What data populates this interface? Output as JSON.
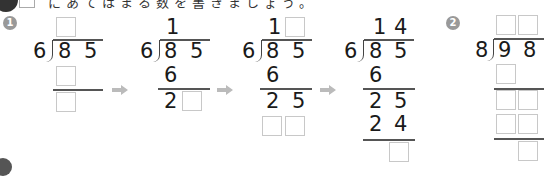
{
  "header": {
    "instruction": "にあてはまる数を書きましょう。"
  },
  "problems": [
    {
      "badge": "1",
      "divisor": "6",
      "dividend": [
        "8",
        "5"
      ],
      "steps": [
        {
          "quotient": [
            "",
            ""
          ],
          "lines": []
        },
        {
          "quotient": [
            "1",
            ""
          ],
          "product1": [
            "6"
          ],
          "remainder1": [
            "2",
            ""
          ]
        },
        {
          "quotient": [
            "1",
            ""
          ],
          "product1": [
            "6"
          ],
          "remainder1": [
            "2",
            "5"
          ]
        },
        {
          "quotient": [
            "1",
            "4"
          ],
          "product1": [
            "6"
          ],
          "remainder1": [
            "2",
            "5"
          ],
          "product2": [
            "2",
            "4"
          ],
          "final_remainder": [
            ""
          ]
        }
      ]
    },
    {
      "badge": "2",
      "divisor": "8",
      "dividend": [
        "9",
        "8"
      ]
    }
  ],
  "arrows": [
    "→",
    "→",
    "→"
  ]
}
